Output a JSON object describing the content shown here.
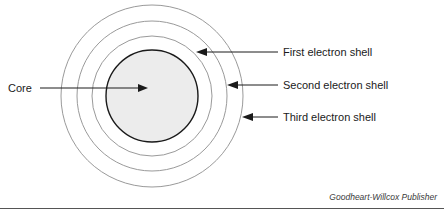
{
  "figure": {
    "type": "atom-shell-diagram",
    "core": {
      "label": "Core",
      "fill_color": "#ececec",
      "stroke_color": "#1a1a1a",
      "center": {
        "x": 152,
        "y": 96
      },
      "radius": 46
    },
    "shells": [
      {
        "name": "first-electron-shell",
        "label": "First electron shell",
        "radius": 60,
        "stroke_color": "#9a9a9a",
        "arrow_tip": {
          "x": 197,
          "y": 52
        },
        "label_position": {
          "x": 283,
          "y": 56
        }
      },
      {
        "name": "second-electron-shell",
        "label": "Second electron shell",
        "radius": 75,
        "stroke_color": "#9a9a9a",
        "arrow_tip": {
          "x": 228,
          "y": 85
        },
        "label_position": {
          "x": 283,
          "y": 89
        }
      },
      {
        "name": "third-electron-shell",
        "label": "Third electron shell",
        "radius": 91,
        "stroke_color": "#9a9a9a",
        "arrow_tip": {
          "x": 243,
          "y": 117
        },
        "label_position": {
          "x": 283,
          "y": 121
        }
      }
    ],
    "core_label_position": {
      "x": 8,
      "y": 92
    },
    "core_arrow_tip": {
      "x": 142,
      "y": 88
    }
  },
  "credit": {
    "text": "Goodheart-Willcox Publisher",
    "position": {
      "x": 437,
      "y": 200
    }
  }
}
